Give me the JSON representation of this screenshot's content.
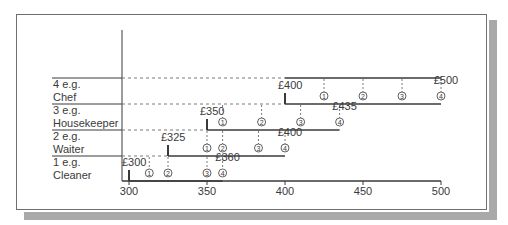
{
  "chart_data": {
    "type": "diagram",
    "title": "",
    "x_axis": {
      "min": 300,
      "max": 500,
      "ticks": [
        300,
        350,
        400,
        450,
        500
      ],
      "tick_labels": [
        "300",
        "350",
        "400",
        "450",
        "500"
      ]
    },
    "grades": [
      {
        "grade": 1,
        "label_line1": "1 e.g.",
        "label_line2": "Cleaner",
        "start": 300,
        "start_label": "£300",
        "end": 360,
        "end_label": "£360",
        "points": [
          313,
          325,
          350,
          360
        ],
        "point_labels": [
          "1",
          "2",
          "3",
          "4"
        ]
      },
      {
        "grade": 2,
        "label_line1": "2 e.g.",
        "label_line2": "Waiter",
        "start": 325,
        "start_label": "£325",
        "end": 400,
        "end_label": "£400",
        "points": [
          350,
          360,
          383,
          400
        ],
        "point_labels": [
          "1",
          "2",
          "3",
          "4"
        ]
      },
      {
        "grade": 3,
        "label_line1": "3 e.g.",
        "label_line2": "Housekeeper",
        "start": 350,
        "start_label": "£350",
        "end": 435,
        "end_label": "£435",
        "points": [
          360,
          385,
          410,
          435
        ],
        "point_labels": [
          "1",
          "2",
          "3",
          "4"
        ]
      },
      {
        "grade": 4,
        "label_line1": "4 e.g.",
        "label_line2": "Chef",
        "start": 400,
        "start_label": "£400",
        "end": 500,
        "end_label": "£500",
        "points": [
          425,
          450,
          475,
          500
        ],
        "point_labels": [
          "1",
          "2",
          "3",
          "4"
        ]
      }
    ]
  },
  "colors": {
    "line": "#3a3a3a",
    "dash": "#7a7a7a",
    "frame": "#6f6f6f",
    "shadow": "#a9a9a9",
    "text": "#3a3a3a"
  }
}
